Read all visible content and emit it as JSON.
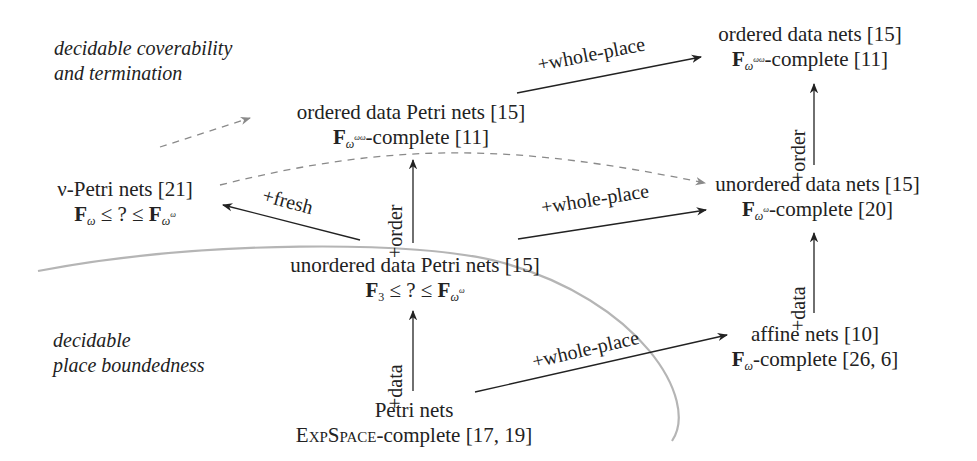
{
  "regions": {
    "top": {
      "line1": "decidable coverability",
      "line2": "and termination"
    },
    "bottom": {
      "line1": "decidable",
      "line2": "place boundedness"
    }
  },
  "nodes": {
    "petri_nets": {
      "name": "Petri nets",
      "complexity_prefix": "ExpSpace",
      "complexity_suffix": "-complete [17, 19]"
    },
    "unordered_data_petri_nets": {
      "name": "unordered data Petri nets [15]",
      "bound_low": "F",
      "bound_low_sub": "3",
      "bound_mid": " ≤ ? ≤ ",
      "bound_high": "F",
      "bound_high_sub": "ω",
      "bound_high_sup": "ω"
    },
    "nu_petri_nets": {
      "name": "ν-Petri nets [21]",
      "bound_low": "F",
      "bound_low_sub": "ω",
      "bound_mid": " ≤ ? ≤ ",
      "bound_high": "F",
      "bound_high_sub": "ω",
      "bound_high_sup": "ω"
    },
    "ordered_data_petri_nets": {
      "name": "ordered data Petri nets [15]",
      "class": "F",
      "class_sub": "ω",
      "class_sup": "ωω",
      "suffix": "-complete [11]"
    },
    "ordered_data_nets": {
      "name": "ordered data nets [15]",
      "class": "F",
      "class_sub": "ω",
      "class_sup": "ωω",
      "suffix": "-complete [11]"
    },
    "unordered_data_nets": {
      "name": "unordered data nets [15]",
      "class": "F",
      "class_sub": "ω",
      "class_sup": "ω",
      "suffix": "-complete [20]"
    },
    "affine_nets": {
      "name": "affine nets [10]",
      "class": "F",
      "class_sub": "ω",
      "suffix": "-complete [26, 6]"
    }
  },
  "edges": {
    "petri_to_unordered_data_petri": "+data",
    "petri_to_affine": "+whole-place",
    "unordered_data_petri_to_ordered_data_petri": "+order",
    "unordered_data_petri_to_nu": "+fresh",
    "unordered_data_petri_to_unordered_data_nets": "+whole-place",
    "affine_to_unordered_data_nets": "+data",
    "unordered_data_nets_to_ordered_data_nets": "+order",
    "ordered_data_petri_to_ordered_data_nets": "+whole-place"
  },
  "colors": {
    "ink": "#222222",
    "dashed": "#8a8a8a",
    "boundary": "#b5b5b5"
  }
}
